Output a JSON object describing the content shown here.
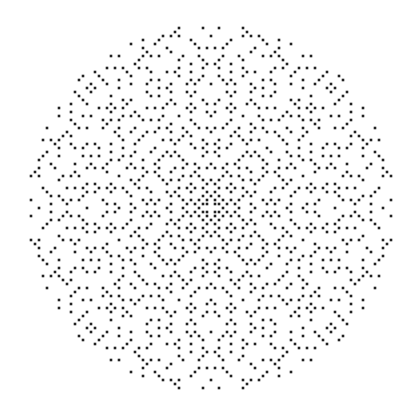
{
  "figure": {
    "background": "#ffffff",
    "dot_color": "#222222",
    "center": [
      211,
      208
    ],
    "radius": 184,
    "cell": 4,
    "dot_size": 2.6
  }
}
